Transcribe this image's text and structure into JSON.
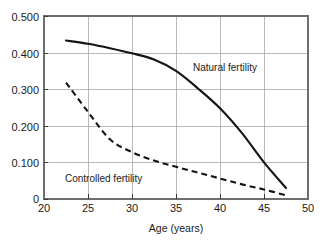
{
  "chart_data": {
    "type": "line",
    "title": "",
    "xlabel": "Age (years)",
    "ylabel": "",
    "xlim": [
      20,
      50
    ],
    "ylim": [
      0,
      0.5
    ],
    "grid": true,
    "legend_position": "inline-annotation",
    "xticks": [
      20,
      25,
      30,
      35,
      40,
      45,
      50
    ],
    "xtick_labels": [
      "20",
      "25",
      "30",
      "35",
      "40",
      "45",
      "50"
    ],
    "yticks": [
      0,
      0.1,
      0.2,
      0.3,
      0.4,
      0.5
    ],
    "ytick_labels": [
      "0",
      "0.100",
      "0.200",
      "0.300",
      "0.400",
      "0.500"
    ],
    "series": [
      {
        "name": "Natural fertility",
        "style": "solid",
        "color": "#141414",
        "annotation": "Natural fertility",
        "x": [
          22.5,
          25.0,
          27.5,
          30.0,
          32.5,
          35.0,
          37.5,
          40.0,
          42.5,
          45.0,
          47.5
        ],
        "values": [
          0.433,
          0.424,
          0.412,
          0.398,
          0.381,
          0.35,
          0.302,
          0.248,
          0.18,
          0.1,
          0.03
        ]
      },
      {
        "name": "Controlled fertility",
        "style": "dashed",
        "color": "#141414",
        "annotation": "Controlled fertility",
        "x": [
          22.5,
          25.0,
          27.5,
          30.0,
          32.5,
          35.0,
          37.5,
          40.0,
          42.5,
          45.0,
          47.5
        ],
        "values": [
          0.318,
          0.238,
          0.163,
          0.128,
          0.105,
          0.088,
          0.072,
          0.056,
          0.04,
          0.026,
          0.01
        ]
      }
    ],
    "annotations": [
      {
        "text": "Natural fertility",
        "x": 38.5,
        "y": 0.355
      },
      {
        "text": "Controlled fertility",
        "x": 26.4,
        "y": 0.072
      }
    ]
  }
}
